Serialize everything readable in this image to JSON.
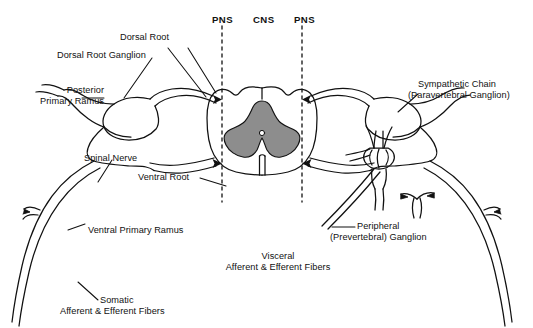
{
  "figure": {
    "type": "anatomical-diagram",
    "colors": {
      "ink": "#111111",
      "gray_matter": "#8d8d8d",
      "white_matter": "#ffffff",
      "background": "#ffffff"
    }
  },
  "region_labels": [
    {
      "id": "pns-left",
      "text": "PNS"
    },
    {
      "id": "cns",
      "text": "CNS"
    },
    {
      "id": "pns-right",
      "text": "PNS"
    }
  ],
  "structure_labels": [
    {
      "id": "dorsal-root",
      "line1": "Dorsal Root",
      "line2": ""
    },
    {
      "id": "dorsal-root-ganglion",
      "line1": "Dorsal Root Ganglion",
      "line2": ""
    },
    {
      "id": "posterior-primary-ramus",
      "line1": "Posterior",
      "line2": "Primary Ramus"
    },
    {
      "id": "spinal-nerve",
      "line1": "Spinal Nerve",
      "line2": ""
    },
    {
      "id": "ventral-root",
      "line1": "Ventral Root",
      "line2": ""
    },
    {
      "id": "ventral-primary-ramus",
      "line1": "Ventral Primary Ramus",
      "line2": ""
    },
    {
      "id": "somatic-fibers",
      "line1": "Somatic",
      "line2": "Afferent & Efferent Fibers"
    },
    {
      "id": "visceral-fibers",
      "line1": "Visceral",
      "line2": "Afferent & Efferent Fibers"
    },
    {
      "id": "peripheral-ganglion",
      "line1": "Peripheral",
      "line2": "(Prevertebral) Ganglion"
    },
    {
      "id": "sympathetic-chain",
      "line1": "Sympathetic Chain",
      "line2": "(Paravertebral Ganglion)"
    }
  ]
}
